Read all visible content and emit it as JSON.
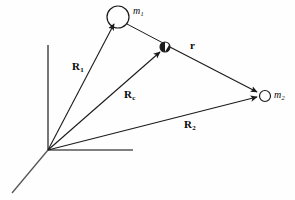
{
  "figure": {
    "background_color": "#fefefe",
    "stroke_color": "#1a1a1a",
    "axis_color": "#555555"
  },
  "axes": {
    "origin_label": "origin",
    "items": [
      {
        "name": "y-axis",
        "description": "vertical axis upward",
        "x1": 48,
        "y1": 150,
        "x2": 48,
        "y2": 45
      },
      {
        "name": "x-axis",
        "description": "horizontal axis to the right",
        "x1": 48,
        "y1": 150,
        "x2": 133,
        "y2": 150
      },
      {
        "name": "z-axis",
        "description": "perspective axis toward lower left",
        "x1": 48,
        "y1": 150,
        "x2": 12,
        "y2": 193
      }
    ]
  },
  "bodies": [
    {
      "id": "m1",
      "label": "m",
      "subscript": "1",
      "shape": "open-circle",
      "cx": 118,
      "cy": 17,
      "r": 11,
      "label_x": 133,
      "label_y": 6
    },
    {
      "id": "m2",
      "label": "m",
      "subscript": "2",
      "shape": "open-circle",
      "cx": 265,
      "cy": 96,
      "r": 5.5,
      "label_x": 274,
      "label_y": 90
    },
    {
      "id": "center-of-mass",
      "label": "",
      "subscript": "",
      "shape": "half-filled-circle",
      "cx": 165,
      "cy": 47,
      "r": 5,
      "label_x": 0,
      "label_y": 0
    }
  ],
  "vectors": [
    {
      "id": "R1",
      "label": "R",
      "subscript": "1",
      "from": "origin",
      "to": "m1",
      "x1": 48,
      "y1": 150,
      "x2": 114,
      "y2": 24,
      "label_x": 72,
      "label_y": 61
    },
    {
      "id": "Rc",
      "label": "R",
      "subscript": "c",
      "from": "origin",
      "to": "center-of-mass",
      "x1": 48,
      "y1": 150,
      "x2": 160,
      "y2": 52,
      "label_x": 124,
      "label_y": 89
    },
    {
      "id": "R2",
      "label": "R",
      "subscript": "2",
      "from": "origin",
      "to": "m2",
      "x1": 48,
      "y1": 150,
      "x2": 258,
      "y2": 97,
      "label_x": 184,
      "label_y": 119
    },
    {
      "id": "r",
      "label": "r",
      "subscript": "",
      "from": "center-of-mass",
      "to": "m2",
      "x1": 168,
      "y1": 46,
      "x2": 258,
      "y2": 92,
      "label_x": 190,
      "label_y": 40
    }
  ],
  "connectors": [
    {
      "id": "m1-to-com",
      "description": "line from m1 circle down to the center of mass marker",
      "x1": 127,
      "y1": 24,
      "x2": 163,
      "y2": 43
    }
  ]
}
